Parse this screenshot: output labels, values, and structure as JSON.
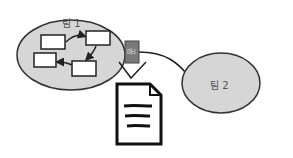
{
  "diagram": {
    "team1": {
      "label": "팀 1",
      "fill": "#d6d6d6",
      "stroke": "#333333"
    },
    "team2": {
      "label": "팀 2",
      "fill": "#d6d6d6",
      "stroke": "#333333"
    },
    "connector": {
      "label": "문",
      "fill": "#7a7a7a"
    },
    "document": {
      "icon": "document-icon"
    },
    "nodes": 4
  }
}
